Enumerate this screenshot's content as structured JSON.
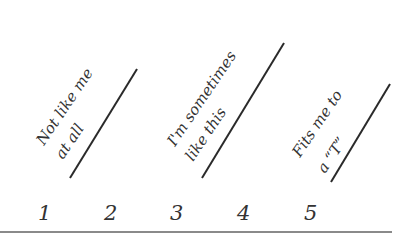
{
  "scale": {
    "anchors": [
      {
        "line1": "Not like me",
        "line2": "at all"
      },
      {
        "line1": "I'm sometimes",
        "line2": "like this"
      },
      {
        "line1": "Fits me to",
        "line2": "a “T”"
      }
    ],
    "numbers": [
      "1",
      "2",
      "3",
      "4",
      "5"
    ]
  },
  "colors": {
    "ink": "#333333",
    "rule": "#8a8a8a",
    "background": "#ffffff"
  }
}
